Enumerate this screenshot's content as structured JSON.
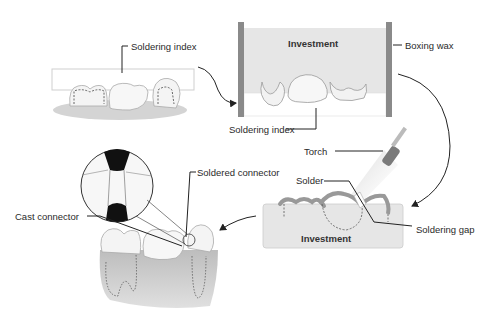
{
  "diagram": {
    "labels": {
      "soldering_index_top": "Soldering index",
      "investment_top": "Investment",
      "boxing_wax": "Boxing wax",
      "soldering_index_bottom": "Soldering index",
      "torch": "Torch",
      "solder": "Solder",
      "soldering_gap": "Soldering gap",
      "investment_bottom": "Investment",
      "soldered_connector": "Soldered connector",
      "cast_connector": "Cast connector"
    },
    "colors": {
      "investment_fill": "#e6e6e6",
      "boxing_wax": "#8a8a8a",
      "tooth": "#f4f4f4",
      "gingiva": "#c8c8c8",
      "line": "#333333",
      "solder_dark": "#111111"
    },
    "steps": [
      "Bridge units assembled with soldering index",
      "Index invested in box with boxing wax",
      "Soldering with torch at soldering gap",
      "Finished bridge with cast and soldered connectors"
    ]
  }
}
